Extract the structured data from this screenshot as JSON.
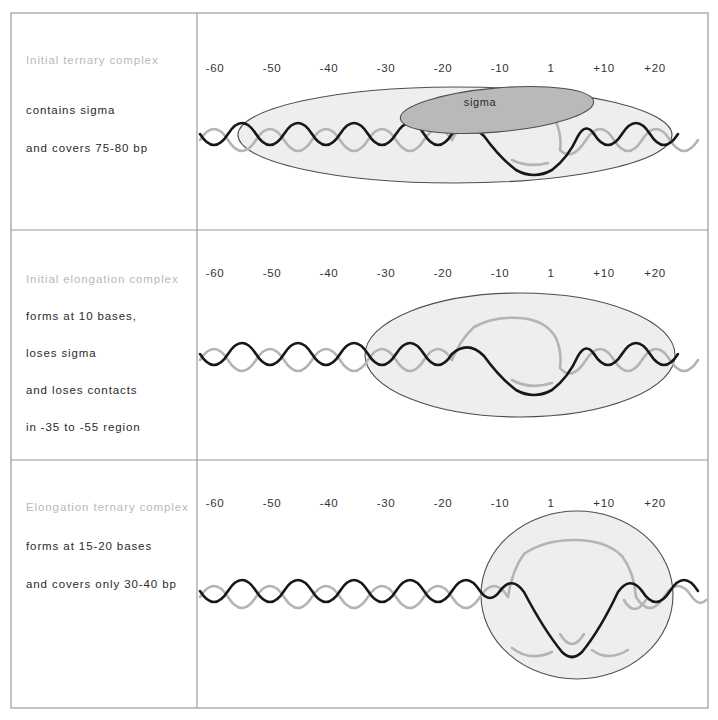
{
  "figure": {
    "width": 718,
    "height": 720,
    "background_color": "#ffffff",
    "frame_color": "#9a9a9a"
  },
  "colors": {
    "heading_text": "#b9b9b9",
    "body_text": "#2a2a2a",
    "scale_text": "#333333",
    "footprint_fill": "#eeeeee",
    "footprint_stroke": "#4f4f4f",
    "sigma_fill": "#b9b9b9",
    "strand_dark": "#171717",
    "strand_light": "#b4b4b4"
  },
  "scale": {
    "labels": [
      "-60",
      "-50",
      "-40",
      "-30",
      "-20",
      "-10",
      "1",
      "+10",
      "+20"
    ],
    "x_positions": [
      215,
      272,
      329,
      386,
      443,
      500,
      551,
      604,
      655
    ]
  },
  "panels": [
    {
      "id": "initial-ternary-complex",
      "heading": "Initial ternary complex",
      "lines": [
        "contains sigma",
        "and covers 75-80 bp"
      ],
      "scale_y": 72,
      "sigma_label": "sigma",
      "footprint": {
        "cx": 455,
        "cy": 135,
        "rx": 217,
        "ry": 48
      },
      "sigma_bubble": {
        "cx": 497,
        "cy": 110,
        "rx": 97,
        "ry": 22,
        "rotate": -5
      }
    },
    {
      "id": "initial-elongation-complex",
      "heading": "Initial elongation complex",
      "lines": [
        "forms at 10 bases,",
        "loses sigma",
        "and loses contacts",
        "in -35 to -55 region"
      ],
      "scale_y": 277,
      "sigma_label": null,
      "footprint": {
        "cx": 520,
        "cy": 355,
        "rx": 155,
        "ry": 62
      },
      "sigma_bubble": null
    },
    {
      "id": "elongation-ternary-complex",
      "heading": "Elongation ternary complex",
      "lines": [
        "forms at 15-20 bases",
        "and covers only 30-40 bp"
      ],
      "scale_y": 507,
      "sigma_label": null,
      "footprint": {
        "cx": 577,
        "cy": 595,
        "rx": 96,
        "ry": 84
      },
      "sigma_bubble": null
    }
  ],
  "layout": {
    "frame": {
      "x": 11,
      "y": 13,
      "width": 697,
      "height": 695
    },
    "column_divider_x": 197,
    "row_dividers_y": [
      230,
      460
    ],
    "helix_axis_y": [
      137,
      355,
      592
    ]
  }
}
